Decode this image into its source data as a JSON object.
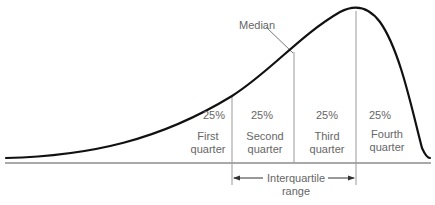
{
  "diagram": {
    "callout": "Median",
    "quarters": [
      {
        "percent": "25%",
        "line1": "First",
        "line2": "quarter"
      },
      {
        "percent": "25%",
        "line1": "Second",
        "line2": "quarter"
      },
      {
        "percent": "25%",
        "line1": "Third",
        "line2": "quarter"
      },
      {
        "percent": "25%",
        "line1": "Fourth",
        "line2": "quarter"
      }
    ],
    "range_label_line1": "Interquartile",
    "range_label_line2": "range",
    "colors": {
      "curve": "#111111",
      "divider": "#999999",
      "text": "#666666",
      "baseline": "#555555"
    }
  }
}
